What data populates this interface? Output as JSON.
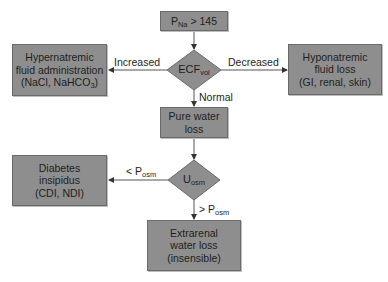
{
  "diagram": {
    "colors": {
      "box_fill": "#8e8e8e",
      "box_border": "#6a6a6a",
      "line": "#555555",
      "text": "#1e1e1e",
      "background": "#ffffff"
    },
    "nodes": {
      "start": {
        "main": "P",
        "sub": "Na",
        "rest": " > 145"
      },
      "ecf_decision": {
        "main": "ECF",
        "sub": "vol"
      },
      "hypernatremic": {
        "lines": [
          "Hypernatremic",
          "fluid administration",
          "(NaCl, NaHCO"
        ],
        "sub": "3",
        "close": ")"
      },
      "hyponatremic": {
        "lines": [
          "Hyponatremic",
          "fluid loss",
          "(GI, renal, skin)"
        ]
      },
      "pure_water": {
        "lines": [
          "Pure water",
          "loss"
        ]
      },
      "uosm_decision": {
        "main": "U",
        "sub": "osm"
      },
      "diabetes": {
        "lines": [
          "Diabetes",
          "insipidus",
          "(CDI, NDI)"
        ]
      },
      "extrarenal": {
        "lines": [
          "Extrarenal",
          "water loss",
          "(insensible)"
        ]
      }
    },
    "edges": {
      "increased": "Increased",
      "decreased": "Decreased",
      "normal": "Normal",
      "less_posm": {
        "prefix": "< P",
        "sub": "osm"
      },
      "greater_posm": {
        "prefix": "> P",
        "sub": "osm"
      }
    }
  }
}
